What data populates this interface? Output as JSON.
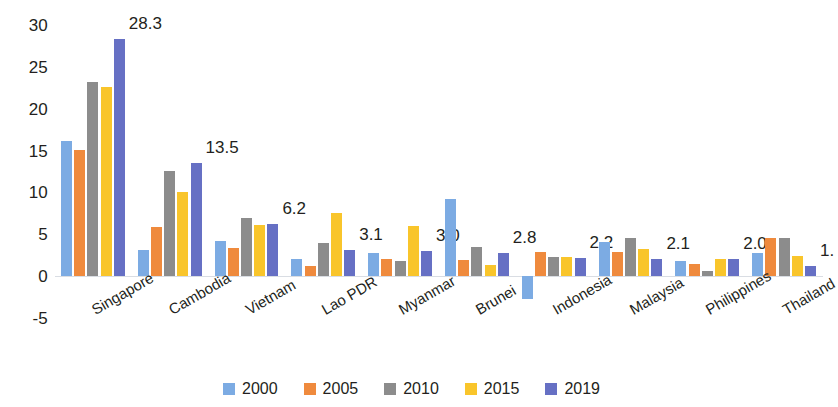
{
  "chart_data": {
    "type": "bar",
    "title": "",
    "subtitle": "",
    "xlabel": "",
    "ylabel": "",
    "ylim": [
      -5,
      30
    ],
    "yticks": [
      30,
      25,
      20,
      15,
      10,
      5,
      0,
      -5
    ],
    "ytick_labels": [
      "30",
      "25",
      "20",
      "15",
      "10",
      "5",
      "0",
      "-5"
    ],
    "grid": false,
    "legend_position": "bottom",
    "categories": [
      "Singapore",
      "Cambodia",
      "Vietnam",
      "Lao PDR",
      "Myanmar",
      "Brunei",
      "Indonesia",
      "Malaysia",
      "Philippines",
      "Thailand"
    ],
    "series": [
      {
        "name": "2000",
        "color": "#7cabe3",
        "values": [
          16.2,
          3.1,
          4.2,
          2.0,
          2.8,
          9.2,
          -2.7,
          4.1,
          1.8,
          2.8
        ]
      },
      {
        "name": "2005",
        "color": "#ef8a3d",
        "values": [
          15.1,
          5.9,
          3.4,
          1.2,
          2.1,
          1.9,
          2.9,
          2.9,
          1.5,
          4.5
        ]
      },
      {
        "name": "2010",
        "color": "#8c8c8c",
        "values": [
          23.2,
          12.6,
          6.9,
          4.0,
          1.8,
          3.5,
          2.3,
          4.5,
          0.6,
          4.5
        ]
      },
      {
        "name": "2015",
        "color": "#f9c52b",
        "values": [
          22.6,
          10.1,
          6.1,
          7.6,
          6.0,
          1.3,
          2.3,
          3.3,
          2.0,
          2.4
        ]
      },
      {
        "name": "2019",
        "color": "#6670c4",
        "values": [
          28.3,
          13.5,
          6.2,
          3.1,
          3.0,
          2.8,
          2.2,
          2.1,
          2.0,
          1.2
        ]
      }
    ],
    "data_labels": {
      "series": "2019",
      "values": [
        "28.3",
        "13.5",
        "6.2",
        "3.1",
        "3.0",
        "2.8",
        "2.2",
        "2.1",
        "2.0",
        "1."
      ]
    }
  }
}
